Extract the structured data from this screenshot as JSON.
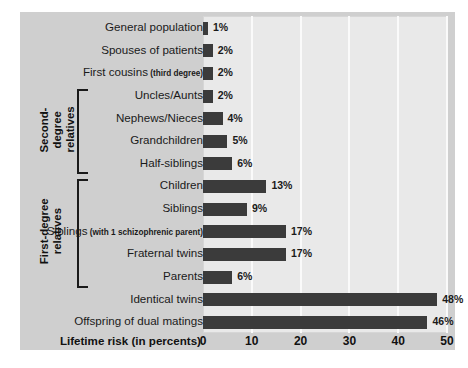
{
  "chart_data": {
    "type": "bar",
    "orientation": "horizontal",
    "title": "",
    "xlabel": "Lifetime risk (in percents)",
    "ylabel": "",
    "xlim": [
      0,
      50
    ],
    "xticks": [
      0,
      10,
      20,
      30,
      40,
      50
    ],
    "grid": "vertical",
    "legend": "none",
    "bar_color": "#3b3b3b",
    "plot_background": "#e9e9e9",
    "panel_background": "#cfcfcf",
    "categories": [
      "General population",
      "Spouses of patients",
      "First cousins",
      "Uncles/Aunts",
      "Nephews/Nieces",
      "Grandchildren",
      "Half-siblings",
      "Children",
      "Siblings",
      "Siblings",
      "Fraternal twins",
      "Parents",
      "Identical twins",
      "Offspring of dual matings"
    ],
    "values": [
      1,
      2,
      2,
      2,
      4,
      5,
      6,
      13,
      9,
      17,
      17,
      6,
      48,
      46
    ],
    "value_labels": [
      "1%",
      "2%",
      "2%",
      "2%",
      "4%",
      "5%",
      "6%",
      "13%",
      "9%",
      "17%",
      "17%",
      "6%",
      "48%",
      "46%"
    ],
    "rows": [
      {
        "label": "General population",
        "sub": "",
        "value": 1,
        "value_label": "1%"
      },
      {
        "label": "Spouses of patients",
        "sub": "",
        "value": 2,
        "value_label": "2%"
      },
      {
        "label": "First cousins",
        "sub": "(third degree)",
        "value": 2,
        "value_label": "2%"
      },
      {
        "label": "Uncles/Aunts",
        "sub": "",
        "value": 2,
        "value_label": "2%"
      },
      {
        "label": "Nephews/Nieces",
        "sub": "",
        "value": 4,
        "value_label": "4%"
      },
      {
        "label": "Grandchildren",
        "sub": "",
        "value": 5,
        "value_label": "5%"
      },
      {
        "label": "Half-siblings",
        "sub": "",
        "value": 6,
        "value_label": "6%"
      },
      {
        "label": "Children",
        "sub": "",
        "value": 13,
        "value_label": "13%"
      },
      {
        "label": "Siblings",
        "sub": "",
        "value": 9,
        "value_label": "9%"
      },
      {
        "label": "Siblings",
        "sub": "(with 1 schizophrenic parent)",
        "value": 17,
        "value_label": "17%"
      },
      {
        "label": "Fraternal twins",
        "sub": "",
        "value": 17,
        "value_label": "17%"
      },
      {
        "label": "Parents",
        "sub": "",
        "value": 6,
        "value_label": "6%"
      },
      {
        "label": "Identical twins",
        "sub": "",
        "value": 48,
        "value_label": "48%"
      },
      {
        "label": "Offspring of dual matings",
        "sub": "",
        "value": 46,
        "value_label": "46%"
      }
    ],
    "groups": [
      {
        "name": "second-degree-relatives",
        "label": "Second-degree\nrelatives",
        "first_row": 3,
        "last_row": 6
      },
      {
        "name": "first-degree-relatives",
        "label": "First-degree\nrelatives",
        "first_row": 7,
        "last_row": 11
      }
    ]
  }
}
